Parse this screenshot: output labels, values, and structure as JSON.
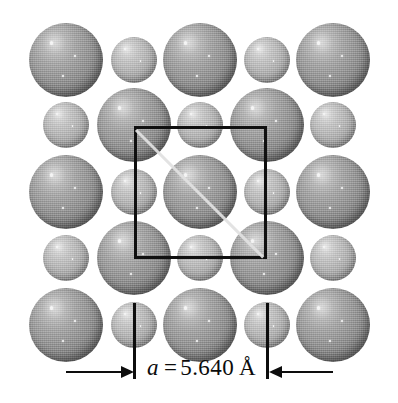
{
  "figure": {
    "background_color": "#ffffff",
    "large_atom_color": "#8d8d8d",
    "small_atom_color": "#b4b4b4",
    "cell_outline_color": "#101010",
    "annotation_color": "#0d0d0d"
  },
  "dimension": {
    "symbol": "a",
    "equals": "=",
    "value": "5.640",
    "unit": "Å",
    "full_label": "a = 5.640 Å",
    "left_tick_x": 134,
    "right_tick_x": 267
  },
  "unit_cell": {
    "left": 134,
    "top": 126,
    "size": 133,
    "diagonal": "top-left-to-bottom-right"
  },
  "lattice": {
    "columns_x": [
      66,
      134,
      200,
      267,
      333
    ],
    "rows_y": [
      60,
      125,
      192,
      258,
      325
    ],
    "large_radius": 37,
    "small_radius": 23,
    "rows": [
      {
        "y": 60,
        "atoms": [
          {
            "x": 66,
            "kind": "large"
          },
          {
            "x": 134,
            "kind": "small"
          },
          {
            "x": 200,
            "kind": "large"
          },
          {
            "x": 267,
            "kind": "small"
          },
          {
            "x": 333,
            "kind": "large"
          }
        ]
      },
      {
        "y": 125,
        "atoms": [
          {
            "x": 66,
            "kind": "small"
          },
          {
            "x": 134,
            "kind": "large"
          },
          {
            "x": 200,
            "kind": "small"
          },
          {
            "x": 267,
            "kind": "large"
          },
          {
            "x": 333,
            "kind": "small"
          }
        ]
      },
      {
        "y": 192,
        "atoms": [
          {
            "x": 66,
            "kind": "large"
          },
          {
            "x": 134,
            "kind": "small"
          },
          {
            "x": 200,
            "kind": "large"
          },
          {
            "x": 267,
            "kind": "small"
          },
          {
            "x": 333,
            "kind": "large"
          }
        ]
      },
      {
        "y": 258,
        "atoms": [
          {
            "x": 66,
            "kind": "small"
          },
          {
            "x": 134,
            "kind": "large"
          },
          {
            "x": 200,
            "kind": "small"
          },
          {
            "x": 267,
            "kind": "large"
          },
          {
            "x": 333,
            "kind": "small"
          }
        ]
      },
      {
        "y": 325,
        "atoms": [
          {
            "x": 66,
            "kind": "large"
          },
          {
            "x": 134,
            "kind": "small"
          },
          {
            "x": 200,
            "kind": "large"
          },
          {
            "x": 267,
            "kind": "small"
          },
          {
            "x": 333,
            "kind": "large"
          }
        ]
      }
    ]
  }
}
